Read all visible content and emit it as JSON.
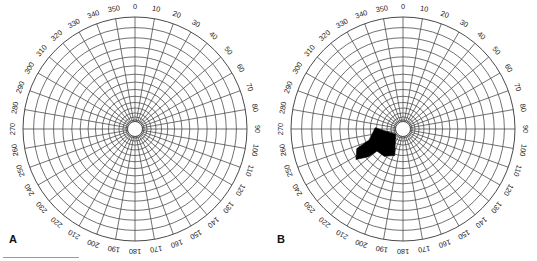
{
  "figure": {
    "type": "polar-diagram-figure",
    "background_color": "#ffffff",
    "panels": [
      {
        "id": "A",
        "letter": "A",
        "has_arrow": false,
        "center": {
          "x": 135,
          "y": 129
        },
        "outer_radius": 112,
        "hub_radius": 7.5
      },
      {
        "id": "B",
        "letter": "B",
        "has_arrow": true,
        "center": {
          "x": 135,
          "y": 129
        },
        "outer_radius": 112,
        "hub_radius": 7.5,
        "arrow": {
          "color": "#000000",
          "points_toward": "center",
          "direction_degrees": 235,
          "description": "thick black arrow pointing up-right toward the hub"
        }
      }
    ],
    "scale_bar": {
      "visible": true,
      "color": "#9a9a9a"
    }
  },
  "chart_data": {
    "type": "polar-grid",
    "title": "",
    "subtitle": "",
    "xlabel": "",
    "ylabel": "",
    "grid": true,
    "legend": false,
    "angle_unit": "degrees",
    "angle_start": 0,
    "angle_direction": "clockwise",
    "angle_step": 10,
    "angle_ticks": [
      0,
      10,
      20,
      30,
      40,
      50,
      60,
      70,
      80,
      90,
      100,
      110,
      120,
      130,
      140,
      150,
      160,
      170,
      180,
      190,
      200,
      210,
      220,
      230,
      240,
      250,
      260,
      270,
      280,
      290,
      300,
      310,
      320,
      330,
      340,
      350
    ],
    "angle_tick_labels": [
      "0",
      "10",
      "20",
      "30",
      "40",
      "50",
      "60",
      "70",
      "80",
      "90",
      "100",
      "110",
      "120",
      "130",
      "140",
      "150",
      "160",
      "170",
      "180",
      "190",
      "200",
      "210",
      "220",
      "230",
      "240",
      "250",
      "260",
      "270",
      "280",
      "290",
      "300",
      "310",
      "320",
      "330",
      "340",
      "350"
    ],
    "radial_rings": 15,
    "radial_rings_labeled": false,
    "radial_tick_labels": [],
    "series": [
      {
        "name": "Panel A grid",
        "panel": "A",
        "values": []
      },
      {
        "name": "Panel B arrow vector",
        "panel": "B",
        "angle_degrees": 235,
        "values": []
      }
    ],
    "colors": {
      "grid_line": "#4a4a4a",
      "axis_line": "#6e6e6e",
      "arrow": "#000000",
      "label_text": "#1c1c1c",
      "background": "#ffffff"
    }
  },
  "labels": {
    "panel_a_letter": "A",
    "panel_b_letter": "B"
  }
}
